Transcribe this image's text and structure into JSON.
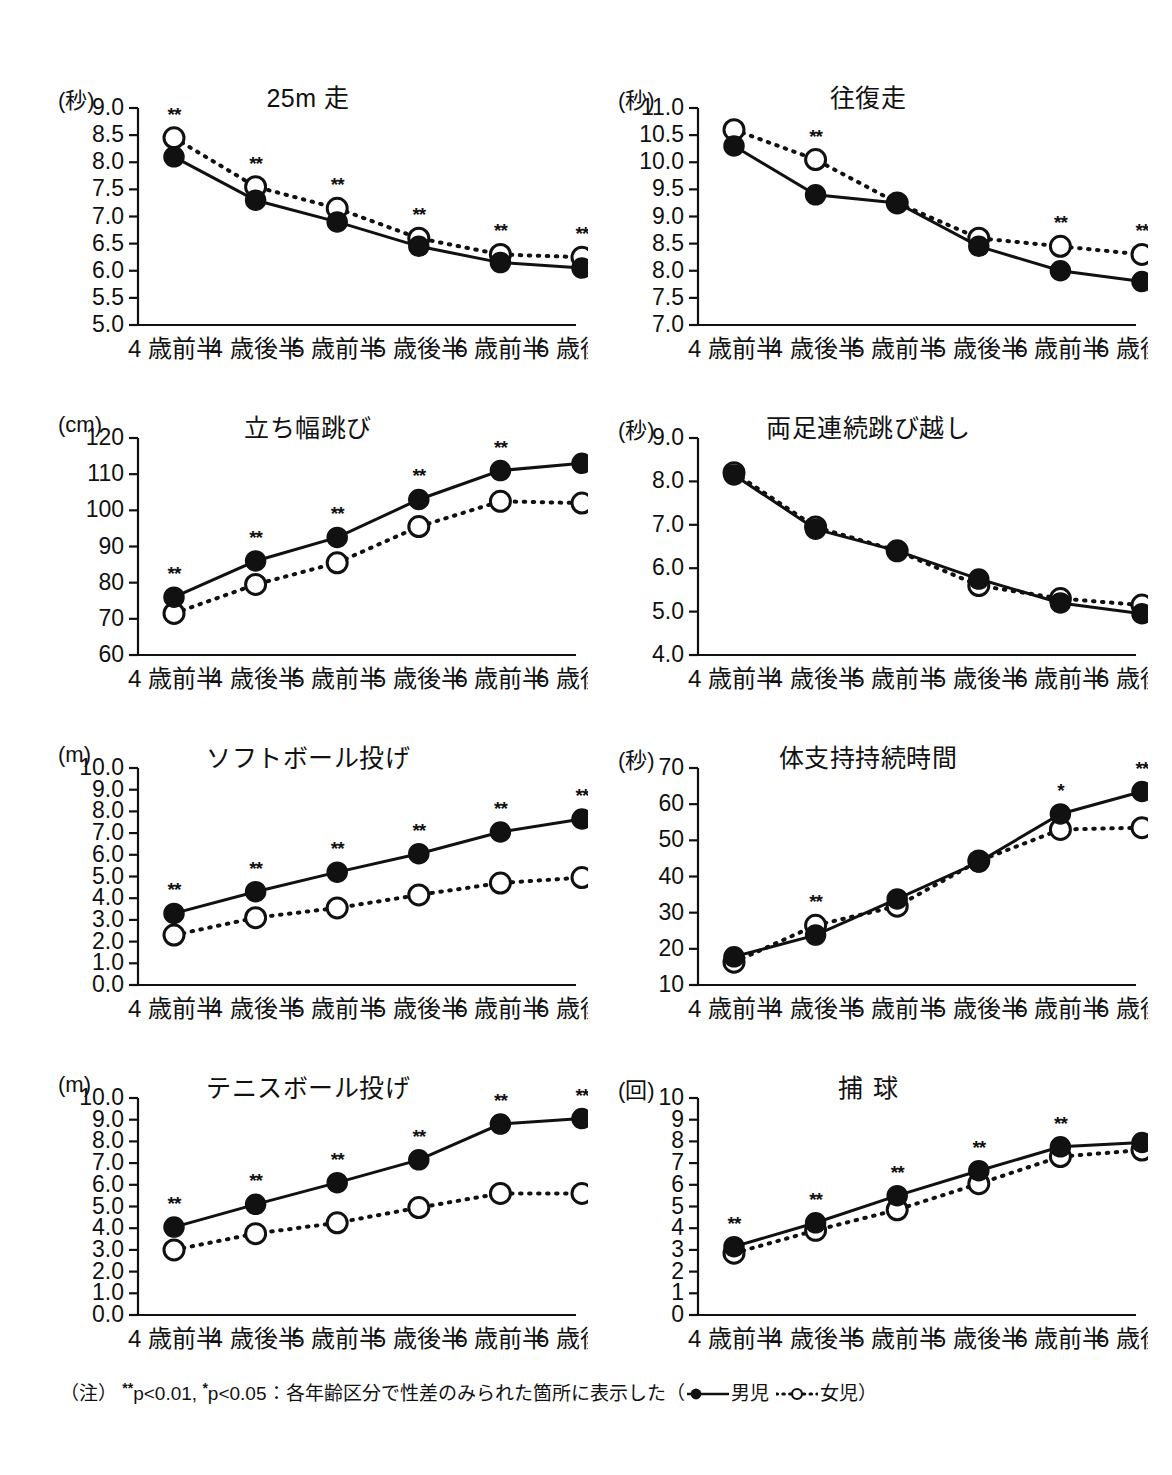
{
  "figure": {
    "footnote": {
      "prefix": "（注）",
      "sig_high": "p<0.01,",
      "sig_high_marks": "**",
      "sig_low": "p<0.05",
      "sig_low_marks": "*",
      "description": "：各年齢区分で性差のみられた箇所に表示した（",
      "legend_boys_label": "男児",
      "legend_girls_label": "女児",
      "suffix": "）"
    },
    "legend": {
      "boys": "男児",
      "girls": "女児"
    },
    "colors": {
      "ink": "#111111",
      "background": "#ffffff",
      "marker_fill_boys": "#111111",
      "marker_fill_girls": "#ffffff"
    }
  },
  "categories": [
    "4 歳前半",
    "4 歳後半",
    "5 歳前半",
    "5 歳後半",
    "6 歳前半",
    "6 歳後半"
  ],
  "chart_data": [
    {
      "id": "chart-25m-run",
      "type": "line",
      "title": "25m 走",
      "unit": "(秒)",
      "ylabel": "秒",
      "xlabel": "",
      "ylim": [
        5.0,
        9.0
      ],
      "yticks": [
        "5.0",
        "5.5",
        "6.0",
        "6.5",
        "7.0",
        "7.5",
        "8.0",
        "8.5",
        "9.0"
      ],
      "ytick_values": [
        5.0,
        5.5,
        6.0,
        6.5,
        7.0,
        7.5,
        8.0,
        8.5,
        9.0
      ],
      "grid": false,
      "legend_position": "figure-footnote",
      "categories": [
        "4 歳前半",
        "4 歳後半",
        "5 歳前半",
        "5 歳後半",
        "6 歳前半",
        "6 歳後半"
      ],
      "series": [
        {
          "name": "男児",
          "marker": "filled-circle",
          "line": "solid",
          "values": [
            8.1,
            7.3,
            6.9,
            6.45,
            6.15,
            6.05
          ]
        },
        {
          "name": "女児",
          "marker": "open-circle",
          "line": "dotted",
          "values": [
            8.45,
            7.55,
            7.15,
            6.6,
            6.3,
            6.25
          ]
        }
      ],
      "significance": [
        "**",
        "**",
        "**",
        "**",
        "**",
        "**"
      ]
    },
    {
      "id": "chart-shuttle-run",
      "type": "line",
      "title": "往復走",
      "unit": "(秒)",
      "ylabel": "秒",
      "xlabel": "",
      "ylim": [
        7.0,
        11.0
      ],
      "yticks": [
        "7.0",
        "7.5",
        "8.0",
        "8.5",
        "9.0",
        "9.5",
        "10.0",
        "10.5",
        "11.0"
      ],
      "ytick_values": [
        7.0,
        7.5,
        8.0,
        8.5,
        9.0,
        9.5,
        10.0,
        10.5,
        11.0
      ],
      "grid": false,
      "legend_position": "figure-footnote",
      "categories": [
        "4 歳前半",
        "4 歳後半",
        "5 歳前半",
        "5 歳後半",
        "6 歳前半",
        "6 歳後半"
      ],
      "series": [
        {
          "name": "男児",
          "marker": "filled-circle",
          "line": "solid",
          "values": [
            10.3,
            9.4,
            9.25,
            8.45,
            8.0,
            7.8
          ]
        },
        {
          "name": "女児",
          "marker": "open-circle",
          "line": "dotted",
          "values": [
            10.6,
            10.05,
            9.25,
            8.6,
            8.45,
            8.3
          ]
        }
      ],
      "significance": [
        "",
        "**",
        "",
        "",
        "**",
        "**"
      ]
    },
    {
      "id": "chart-standing-long-jump",
      "type": "line",
      "title": "立ち幅跳び",
      "unit": "(cm)",
      "ylabel": "cm",
      "xlabel": "",
      "ylim": [
        60,
        120
      ],
      "yticks": [
        "60",
        "70",
        "80",
        "90",
        "100",
        "110",
        "120"
      ],
      "ytick_values": [
        60,
        70,
        80,
        90,
        100,
        110,
        120
      ],
      "grid": false,
      "legend_position": "figure-footnote",
      "categories": [
        "4 歳前半",
        "4 歳後半",
        "5 歳前半",
        "5 歳後半",
        "6 歳前半",
        "6 歳後半"
      ],
      "series": [
        {
          "name": "男児",
          "marker": "filled-circle",
          "line": "solid",
          "values": [
            76,
            86,
            92.5,
            103,
            111,
            113
          ]
        },
        {
          "name": "女児",
          "marker": "open-circle",
          "line": "dotted",
          "values": [
            71.5,
            79.5,
            85.5,
            95.5,
            102.5,
            102
          ]
        }
      ],
      "significance": [
        "**",
        "**",
        "**",
        "**",
        "**",
        ""
      ]
    },
    {
      "id": "chart-two-foot-continuous-jump",
      "type": "line",
      "title": "両足連続跳び越し",
      "unit": "(秒)",
      "ylabel": "秒",
      "xlabel": "",
      "ylim": [
        4.0,
        9.0
      ],
      "yticks": [
        "4.0",
        "5.0",
        "6.0",
        "7.0",
        "8.0",
        "9.0"
      ],
      "ytick_values": [
        4.0,
        5.0,
        6.0,
        7.0,
        8.0,
        9.0
      ],
      "grid": false,
      "legend_position": "figure-footnote",
      "categories": [
        "4 歳前半",
        "4 歳後半",
        "5 歳前半",
        "5 歳後半",
        "6 歳前半",
        "6 歳後半"
      ],
      "series": [
        {
          "name": "男児",
          "marker": "filled-circle",
          "line": "solid",
          "values": [
            8.15,
            6.9,
            6.4,
            5.75,
            5.2,
            4.95
          ]
        },
        {
          "name": "女児",
          "marker": "open-circle",
          "line": "dotted",
          "values": [
            8.2,
            6.95,
            6.4,
            5.6,
            5.3,
            5.15
          ]
        }
      ],
      "significance": [
        "",
        "",
        "",
        "",
        "",
        ""
      ]
    },
    {
      "id": "chart-softball-throw",
      "type": "line",
      "title": "ソフトボール投げ",
      "unit": "(m)",
      "ylabel": "m",
      "xlabel": "",
      "ylim": [
        0.0,
        10.0
      ],
      "yticks": [
        "0.0",
        "1.0",
        "2.0",
        "3.0",
        "4.0",
        "5.0",
        "6.0",
        "7.0",
        "8.0",
        "9.0",
        "10.0"
      ],
      "ytick_values": [
        0.0,
        1.0,
        2.0,
        3.0,
        4.0,
        5.0,
        6.0,
        7.0,
        8.0,
        9.0,
        10.0
      ],
      "grid": false,
      "legend_position": "figure-footnote",
      "categories": [
        "4 歳前半",
        "4 歳後半",
        "5 歳前半",
        "5 歳後半",
        "6 歳前半",
        "6 歳後半"
      ],
      "series": [
        {
          "name": "男児",
          "marker": "filled-circle",
          "line": "solid",
          "values": [
            3.3,
            4.3,
            5.2,
            6.05,
            7.05,
            7.65
          ]
        },
        {
          "name": "女児",
          "marker": "open-circle",
          "line": "dotted",
          "values": [
            2.3,
            3.1,
            3.55,
            4.15,
            4.7,
            4.95
          ]
        }
      ],
      "significance": [
        "**",
        "**",
        "**",
        "**",
        "**",
        "**"
      ]
    },
    {
      "id": "chart-body-support-duration",
      "type": "line",
      "title": "体支持持続時間",
      "unit": "(秒)",
      "ylabel": "秒",
      "xlabel": "",
      "ylim": [
        10,
        70
      ],
      "yticks": [
        "10",
        "20",
        "30",
        "40",
        "50",
        "60",
        "70"
      ],
      "ytick_values": [
        10,
        20,
        30,
        40,
        50,
        60,
        70
      ],
      "grid": false,
      "legend_position": "figure-footnote",
      "categories": [
        "4 歳前半",
        "4 歳後半",
        "5 歳前半",
        "5 歳後半",
        "6 歳前半",
        "6 歳後半"
      ],
      "series": [
        {
          "name": "男児",
          "marker": "filled-circle",
          "line": "solid",
          "values": [
            17.8,
            23.8,
            33.8,
            44.0,
            57.3,
            63.5
          ]
        },
        {
          "name": "女児",
          "marker": "open-circle",
          "line": "dotted",
          "values": [
            16.3,
            26.5,
            31.8,
            44.3,
            53.0,
            53.5
          ]
        }
      ],
      "significance": [
        "",
        "**",
        "",
        "",
        "*",
        "**"
      ]
    },
    {
      "id": "chart-tennis-ball-throw",
      "type": "line",
      "title": "テニスボール投げ",
      "unit": "(m)",
      "ylabel": "m",
      "xlabel": "",
      "ylim": [
        0.0,
        10.0
      ],
      "yticks": [
        "0.0",
        "1.0",
        "2.0",
        "3.0",
        "4.0",
        "5.0",
        "6.0",
        "7.0",
        "8.0",
        "9.0",
        "10.0"
      ],
      "ytick_values": [
        0.0,
        1.0,
        2.0,
        3.0,
        4.0,
        5.0,
        6.0,
        7.0,
        8.0,
        9.0,
        10.0
      ],
      "grid": false,
      "legend_position": "figure-footnote",
      "categories": [
        "4 歳前半",
        "4 歳後半",
        "5 歳前半",
        "5 歳後半",
        "6 歳前半",
        "6 歳後半"
      ],
      "series": [
        {
          "name": "男児",
          "marker": "filled-circle",
          "line": "solid",
          "values": [
            4.05,
            5.1,
            6.1,
            7.15,
            8.8,
            9.05
          ]
        },
        {
          "name": "女児",
          "marker": "open-circle",
          "line": "dotted",
          "values": [
            3.0,
            3.75,
            4.25,
            4.95,
            5.6,
            5.6
          ]
        }
      ],
      "significance": [
        "**",
        "**",
        "**",
        "**",
        "**",
        "**"
      ]
    },
    {
      "id": "chart-catching",
      "type": "line",
      "title": "捕 球",
      "unit": "(回)",
      "ylabel": "回",
      "xlabel": "",
      "ylim": [
        0,
        10
      ],
      "yticks": [
        "0",
        "1",
        "2",
        "3",
        "4",
        "5",
        "6",
        "7",
        "8",
        "9",
        "10"
      ],
      "ytick_values": [
        0,
        1,
        2,
        3,
        4,
        5,
        6,
        7,
        8,
        9,
        10
      ],
      "grid": false,
      "legend_position": "figure-footnote",
      "categories": [
        "4 歳前半",
        "4 歳後半",
        "5 歳前半",
        "5 歳後半",
        "6 歳前半",
        "6 歳後半"
      ],
      "series": [
        {
          "name": "男児",
          "marker": "filled-circle",
          "line": "solid",
          "values": [
            3.15,
            4.25,
            5.5,
            6.65,
            7.75,
            7.95
          ]
        },
        {
          "name": "女児",
          "marker": "open-circle",
          "line": "dotted",
          "values": [
            2.85,
            3.9,
            4.85,
            6.05,
            7.3,
            7.6
          ]
        }
      ],
      "significance": [
        "**",
        "**",
        "**",
        "**",
        "**",
        ""
      ]
    }
  ]
}
